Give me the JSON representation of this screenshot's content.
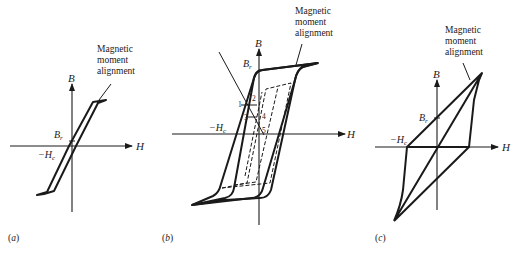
{
  "figure": {
    "panels": [
      {
        "id": "a",
        "caption": "(a)",
        "axis_y_label": "B",
        "axis_x_label": "H",
        "remanence_label": "B",
        "remanence_sub": "r",
        "coercivity_label": "−H",
        "coercivity_sub": "c",
        "annotation_lines": [
          "Magnetic",
          "moment",
          "alignment"
        ]
      },
      {
        "id": "b",
        "caption": "(b)",
        "axis_y_label": "B",
        "axis_x_label": "H",
        "remanence_label": "B",
        "remanence_sub": "r",
        "coercivity_label": "−H",
        "coercivity_sub": "c",
        "annotation_lines": [
          "Magnetic",
          "moment",
          "alignment"
        ],
        "points": [
          "1",
          "2",
          "3",
          "4",
          "5"
        ]
      },
      {
        "id": "c",
        "caption": "(c)",
        "axis_y_label": "B",
        "axis_x_label": "H",
        "remanence_label": "B",
        "remanence_sub": "r",
        "coercivity_label": "−H",
        "coercivity_sub": "c",
        "annotation_lines": [
          "Magnetic",
          "moment",
          "alignment"
        ]
      }
    ],
    "colors": {
      "ink": "#1a1a1a",
      "background": "#ffffff"
    }
  }
}
